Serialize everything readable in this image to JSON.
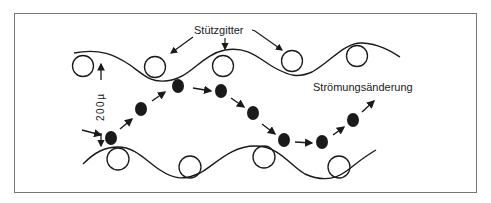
{
  "figure": {
    "labels": {
      "support_grid": "Stützgitter",
      "flow_change": "Strömungsänderung",
      "gap": "200µ"
    },
    "colors": {
      "ink": "#1a1a1a",
      "frame": "#777777",
      "background": "#ffffff"
    }
  }
}
